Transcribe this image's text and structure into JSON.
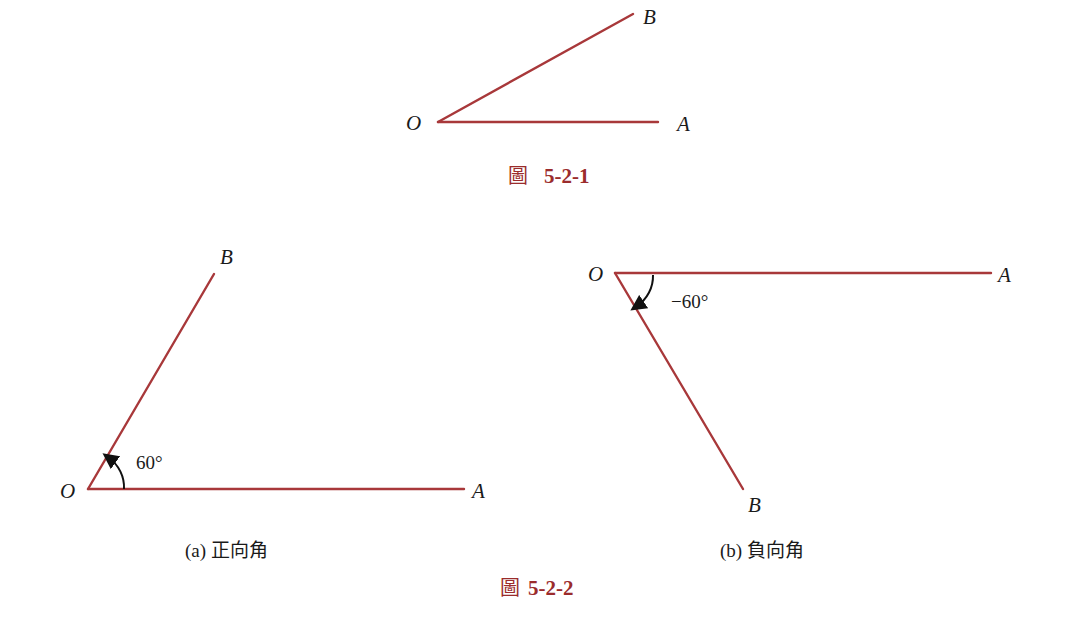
{
  "figure_1": {
    "caption_prefix": "圖",
    "caption_number": "5-2-1",
    "labels": {
      "vertex": "O",
      "initial": "A",
      "terminal": "B"
    }
  },
  "figure_2": {
    "caption_prefix": "圖",
    "caption_number": "5-2-2",
    "panel_a": {
      "caption": "(a) 正向角",
      "angle_label": "60°",
      "labels": {
        "vertex": "O",
        "initial": "A",
        "terminal": "B"
      }
    },
    "panel_b": {
      "caption": "(b) 負向角",
      "angle_label": "−60°",
      "labels": {
        "vertex": "O",
        "initial": "A",
        "terminal": "B"
      }
    }
  },
  "colors": {
    "ray": "#a8383a",
    "caption": "#9b2c2c",
    "text": "#1a1a1a"
  }
}
